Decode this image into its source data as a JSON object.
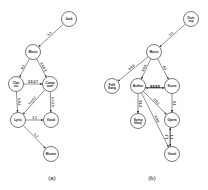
{
  "panels": [
    {
      "caption": "(a)",
      "nodes": [
        {
          "id": "jack",
          "label": "Jack",
          "x": 69,
          "y": 19
        },
        {
          "id": "music",
          "label": "Music",
          "x": 33,
          "y": 52
        },
        {
          "id": "classic",
          "label": "Classic",
          "x": 16,
          "y": 84
        },
        {
          "id": "composer",
          "label": "Composer",
          "x": 50,
          "y": 84
        },
        {
          "id": "lyric",
          "label": "Lyric",
          "x": 18,
          "y": 120
        },
        {
          "id": "vocal",
          "label": "Vocal",
          "x": 51,
          "y": 120
        },
        {
          "id": "mozart",
          "label": "Mozart",
          "x": 51,
          "y": 154
        }
      ],
      "edges": [
        {
          "from": "jack",
          "to": "music",
          "label": "1,1"
        },
        {
          "from": "music",
          "to": "classic",
          "label": "0,1"
        },
        {
          "from": "music",
          "to": "composer",
          "label": "0.5,0.3"
        },
        {
          "from": "classic",
          "to": "composer",
          "label": "0.5,0.7"
        },
        {
          "from": "classic",
          "to": "lyric",
          "label": "0.5,1"
        },
        {
          "from": "composer",
          "to": "lyric",
          "label": "0.5,0.7"
        },
        {
          "from": "composer",
          "to": "vocal",
          "label": "0.7,0.5"
        },
        {
          "from": "lyric",
          "to": "vocal",
          "label": "1,1"
        },
        {
          "from": "lyric",
          "to": "mozart",
          "label": "1,1"
        }
      ]
    },
    {
      "caption": "(b)",
      "nodes": [
        {
          "id": "outstep",
          "label": "Outstep",
          "x": 191,
          "y": 19
        },
        {
          "id": "music",
          "label": "Music",
          "x": 154,
          "y": 52
        },
        {
          "id": "folk",
          "label": "Folk Song",
          "x": 112,
          "y": 86
        },
        {
          "id": "author",
          "label": "Author",
          "x": 138,
          "y": 86
        },
        {
          "id": "score",
          "label": "Score",
          "x": 172,
          "y": 86
        },
        {
          "id": "symphony",
          "label": "Symphony",
          "x": 138,
          "y": 121
        },
        {
          "id": "opera",
          "label": "Opera",
          "x": 172,
          "y": 120
        },
        {
          "id": "vocal",
          "label": "Vocal",
          "x": 172,
          "y": 154
        }
      ],
      "edges": [
        {
          "from": "outstep",
          "to": "music",
          "label": "1,1"
        },
        {
          "from": "music",
          "to": "folk",
          "label": "0.6,0"
        },
        {
          "from": "music",
          "to": "author",
          "label": "0.6,0"
        },
        {
          "from": "music",
          "to": "score",
          "label": "0,1"
        },
        {
          "from": "score",
          "to": "author",
          "label": "0,0.5,1"
        },
        {
          "from": "author",
          "to": "score",
          "label": "0.5,0.5"
        },
        {
          "from": "author",
          "to": "symphony",
          "label": "0.5,0"
        },
        {
          "from": "author",
          "to": "opera",
          "label": "0.5,1"
        },
        {
          "from": "author",
          "to": "vocal",
          "label": "0.5,0"
        },
        {
          "from": "score",
          "to": "opera",
          "label": "0,1"
        },
        {
          "from": "opera",
          "to": "vocal",
          "label": "1,1"
        },
        {
          "from": "vocal",
          "to": "opera",
          "label": "1,1"
        }
      ]
    }
  ]
}
